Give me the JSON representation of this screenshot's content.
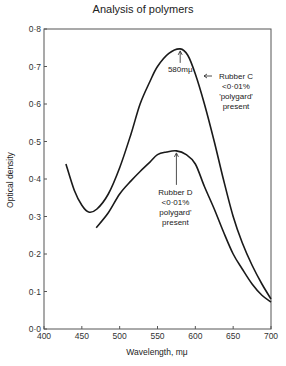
{
  "chart_data": {
    "type": "line",
    "title": "Analysis of polymers",
    "xlabel": "Wavelength,   mμ",
    "ylabel": "Optical density",
    "xlim": [
      400,
      700
    ],
    "ylim": [
      0.0,
      0.8
    ],
    "xticks": [
      "400",
      "450",
      "500",
      "550",
      "600",
      "650",
      "700"
    ],
    "yticks": [
      "0·0",
      "0·1",
      "0·2",
      "0·3",
      "0·4",
      "0·5",
      "0·6",
      "0·7",
      "0·8"
    ],
    "grid": false,
    "legend": "none (inline annotations)",
    "series": [
      {
        "name": "Rubber C <0·01% 'polygard' present",
        "x": [
          429,
          440,
          450,
          459,
          470,
          485,
          500,
          515,
          527,
          540,
          550,
          565,
          580,
          590,
          600,
          612,
          625,
          637,
          650,
          662,
          675,
          688,
          700
        ],
        "y": [
          0.44,
          0.37,
          0.33,
          0.312,
          0.32,
          0.36,
          0.43,
          0.52,
          0.6,
          0.66,
          0.7,
          0.735,
          0.747,
          0.73,
          0.68,
          0.6,
          0.5,
          0.4,
          0.3,
          0.23,
          0.17,
          0.12,
          0.08
        ]
      },
      {
        "name": "Rubber D <0·01% polygard' present",
        "x": [
          469,
          485,
          500,
          515,
          527,
          540,
          550,
          562,
          575,
          588,
          600,
          612,
          625,
          637,
          650,
          662,
          675,
          688,
          700
        ],
        "y": [
          0.27,
          0.31,
          0.36,
          0.395,
          0.42,
          0.445,
          0.465,
          0.472,
          0.475,
          0.465,
          0.44,
          0.38,
          0.32,
          0.26,
          0.2,
          0.16,
          0.12,
          0.09,
          0.072
        ]
      }
    ],
    "annotations": [
      {
        "text": "580mμ",
        "points_to": [
          580,
          0.747
        ]
      },
      {
        "lines": [
          "Rubber C",
          "<0·01%",
          "'polygard'",
          "present"
        ]
      },
      {
        "lines": [
          "Rubber D",
          "<0·01%",
          "polygard'",
          "present"
        ],
        "points_to": [
          575,
          0.475
        ]
      }
    ]
  }
}
